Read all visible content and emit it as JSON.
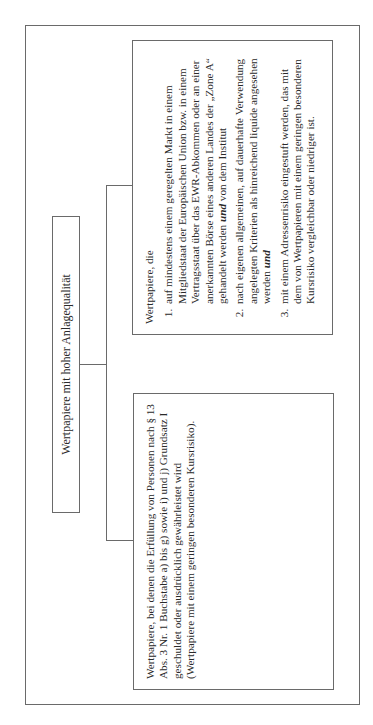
{
  "diagram": {
    "title": "Wertpapiere mit hoher Anlagequalität",
    "left_box": {
      "text": "Wertpapiere, bei denen die Erfüllung von Personen nach § 13 Abs. 3 Nr. 1 Buchstabe a) bis g) sowie i) und j) Grundsatz I geschuldet oder ausdrücklich gewährleistet wird (Wertpapiere mit einem geringen besonderen Kursrisiko)."
    },
    "right_box": {
      "intro": "Wertpapiere, die",
      "items": [
        {
          "number": "1.",
          "text_a": "auf mindestens einem geregelten Markt in einem Mitgliedstaat der Europäischen Union bzw. in einem Vertragsstaat über das EWR-Abkommen oder an einer anerkannten Börse eines anderen Landes der „Zone A“ gehandelt werden ",
          "emph": "und",
          "text_b": " von dem Institut"
        },
        {
          "number": "2.",
          "text_a": "nach eigenen allgemeinen, auf dauerhafte Verwendung angelegten Kriterien als hinreichend liquide angesehen werden ",
          "emph": "und",
          "text_b": ""
        },
        {
          "number": "3.",
          "text_a": "mit einem Adressenrisiko eingestuft werden, das mit dem von Wertpapieren mit einem geringen besonderen Kursrisiko vergleichbar oder niedriger ist.",
          "emph": "",
          "text_b": ""
        }
      ]
    }
  }
}
